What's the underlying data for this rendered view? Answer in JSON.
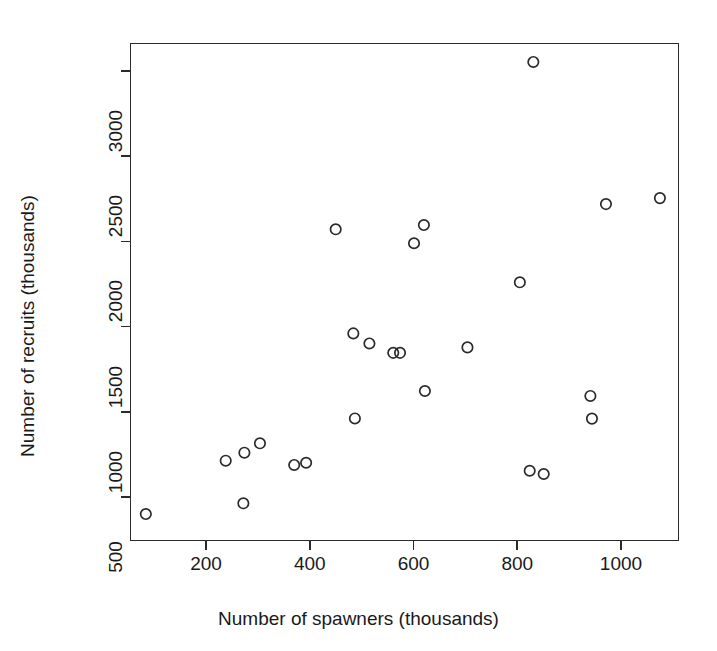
{
  "chart_data": {
    "type": "scatter",
    "title": "",
    "xlabel": "Number of spawners (thousands)",
    "ylabel": "Number of recruits (thousands)",
    "xlim": [
      48,
      1110
    ],
    "ylim": [
      258,
      3180
    ],
    "xticks": [
      200,
      400,
      600,
      800,
      1000
    ],
    "yticks": [
      500,
      1000,
      1500,
      2000,
      2500,
      3000
    ],
    "grid": false,
    "legend": "none",
    "marker": "open-circle",
    "marker_color": "#2a2a2a",
    "n_points": 25,
    "x": [
      84,
      238,
      272,
      274,
      304,
      370,
      393,
      450,
      484,
      487,
      515,
      561,
      574,
      601,
      620,
      622,
      704,
      805,
      824,
      831,
      851,
      941,
      944,
      971,
      1075
    ],
    "y": [
      400,
      713,
      463,
      760,
      815,
      688,
      701,
      2071,
      1460,
      961,
      1401,
      1346,
      1346,
      1989,
      2096,
      1122,
      1378,
      1760,
      654,
      3053,
      635,
      1093,
      960,
      2219,
      2254
    ],
    "points": [
      {
        "x": 84,
        "y": 400
      },
      {
        "x": 238,
        "y": 713
      },
      {
        "x": 272,
        "y": 463
      },
      {
        "x": 274,
        "y": 760
      },
      {
        "x": 304,
        "y": 815
      },
      {
        "x": 370,
        "y": 688
      },
      {
        "x": 393,
        "y": 701
      },
      {
        "x": 450,
        "y": 2071
      },
      {
        "x": 484,
        "y": 1460
      },
      {
        "x": 487,
        "y": 961
      },
      {
        "x": 515,
        "y": 1401
      },
      {
        "x": 561,
        "y": 1346
      },
      {
        "x": 574,
        "y": 1346
      },
      {
        "x": 601,
        "y": 1989
      },
      {
        "x": 620,
        "y": 2096
      },
      {
        "x": 622,
        "y": 1122
      },
      {
        "x": 704,
        "y": 1378
      },
      {
        "x": 805,
        "y": 1760
      },
      {
        "x": 824,
        "y": 654
      },
      {
        "x": 831,
        "y": 3053
      },
      {
        "x": 851,
        "y": 635
      },
      {
        "x": 941,
        "y": 1093
      },
      {
        "x": 944,
        "y": 960
      },
      {
        "x": 971,
        "y": 2219
      },
      {
        "x": 1075,
        "y": 2254
      }
    ]
  },
  "axes": {
    "x_tick_labels": [
      "200",
      "400",
      "600",
      "800",
      "1000"
    ],
    "y_tick_labels": [
      "500",
      "1000",
      "1500",
      "2000",
      "2500",
      "3000"
    ],
    "x_axis_title": "Number of spawners (thousands)",
    "y_axis_title": "Number of recruits (thousands)"
  },
  "style": {
    "frame_color": "#2a2a2a",
    "background": "#ffffff",
    "text_color": "#1a1a1a"
  }
}
